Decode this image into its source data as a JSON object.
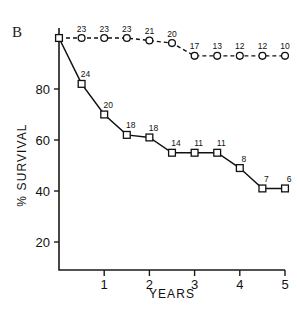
{
  "panel": {
    "label": "B"
  },
  "axes": {
    "ylabel": "% SURVIVAL",
    "xlabel": "YEARS",
    "y_ticks": [
      "20",
      "40",
      "60",
      "80"
    ],
    "x_ticks": [
      "1",
      "2",
      "3",
      "4",
      "5"
    ]
  },
  "chart_data": {
    "type": "line",
    "title": "B",
    "xlabel": "YEARS",
    "ylabel": "% SURVIVAL",
    "xlim": [
      0,
      5
    ],
    "ylim": [
      0,
      100
    ],
    "grid": false,
    "legend": "none",
    "y_ticks": [
      20,
      40,
      60,
      80
    ],
    "x_ticks": [
      1,
      2,
      3,
      4,
      5
    ],
    "x": [
      0,
      0.5,
      1,
      1.5,
      2,
      2.5,
      3,
      3.5,
      4,
      4.5,
      5
    ],
    "series": [
      {
        "name": "upper-curve-dashed",
        "style": "dashed",
        "marker": "open-circle",
        "values": [
          100,
          100,
          100,
          100,
          99,
          98,
          93,
          93,
          93,
          93,
          93
        ],
        "point_labels": [
          "",
          "23",
          "23",
          "23",
          "21",
          "20",
          "17",
          "13",
          "12",
          "12",
          "10"
        ]
      },
      {
        "name": "lower-curve-solid",
        "style": "solid",
        "marker": "open-square",
        "values": [
          100,
          82,
          70,
          62,
          61,
          55,
          55,
          55,
          49,
          41,
          41
        ],
        "point_labels": [
          "",
          "24",
          "20",
          "18",
          "18",
          "14",
          "11",
          "11",
          "8",
          "7",
          "6"
        ]
      }
    ]
  }
}
